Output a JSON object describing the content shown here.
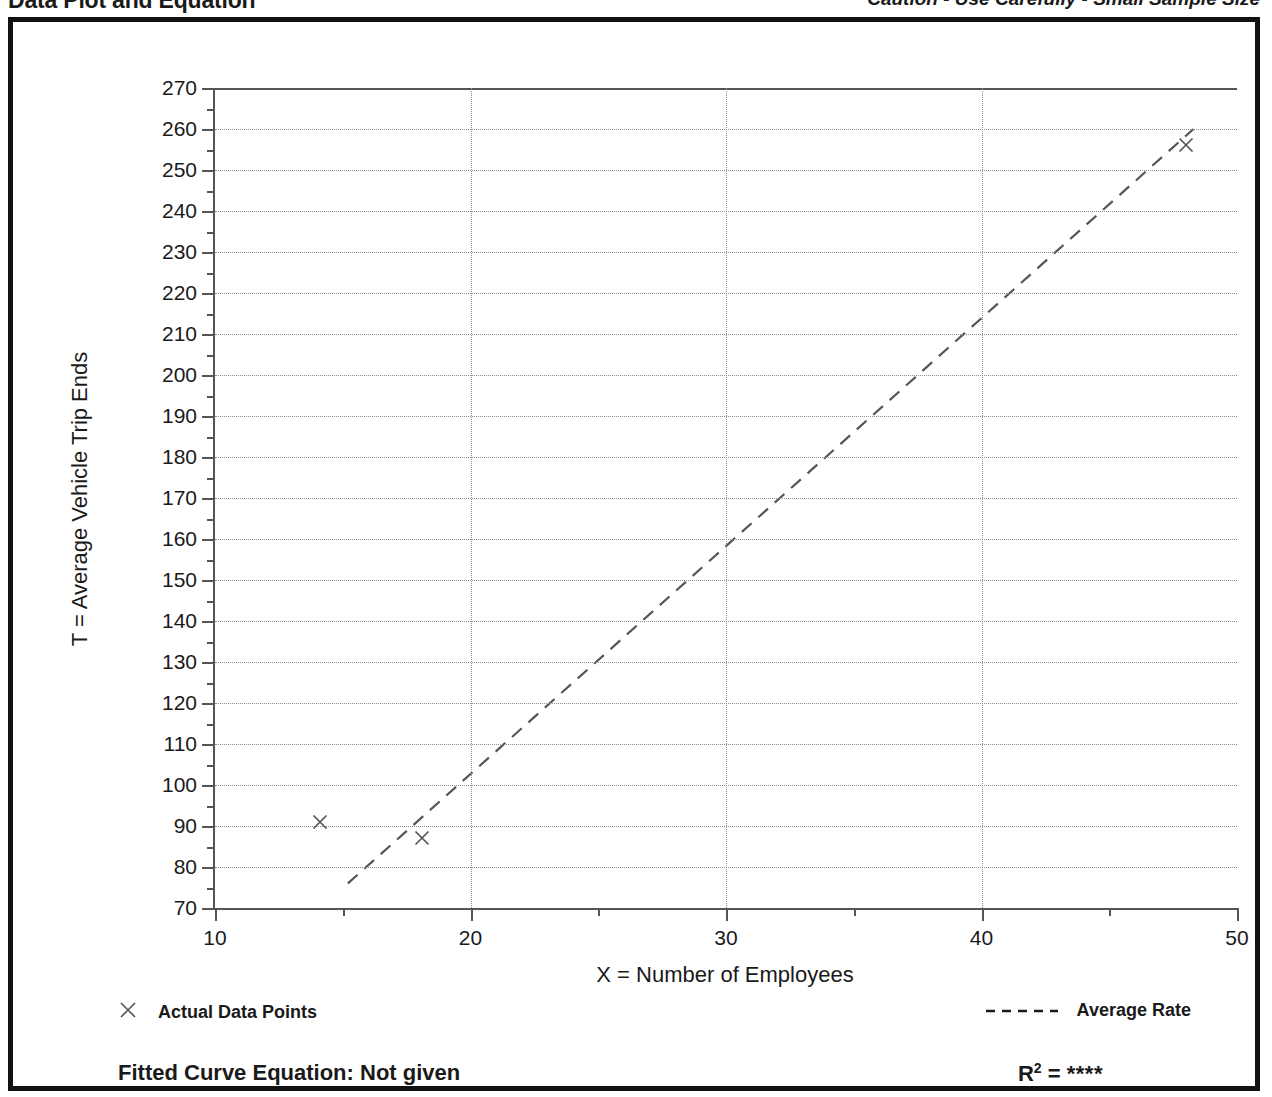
{
  "header": {
    "title": "Data Plot and Equation",
    "caution": "Caution - Use Carefully - Small Sample Size"
  },
  "legend": {
    "data_points_label": "Actual Data Points",
    "average_rate_label": "Average Rate",
    "data_points_marker": "x-marker-icon",
    "average_rate_marker": "dashed-line-icon"
  },
  "footer": {
    "equation_label": "Fitted Curve Equation:  Not given",
    "r2_prefix": "R",
    "r2_superscript": "2",
    "r2_equals": " = ",
    "r2_value": "****"
  },
  "colors": {
    "axis": "#555555",
    "grid": "#8d8d8d",
    "ink": "#1a1a1a",
    "frame": "#111111"
  },
  "chart_data": {
    "type": "scatter",
    "title": "Data Plot and Equation",
    "xlabel": "X = Number of Employees",
    "ylabel": "T = Average Vehicle Trip Ends",
    "xlim": [
      10,
      50
    ],
    "ylim": [
      70,
      270
    ],
    "xticks": [
      10,
      20,
      30,
      40,
      50
    ],
    "xtick_labels": [
      "10",
      "20",
      "30",
      "40",
      "50"
    ],
    "xminor_ticks": [
      15,
      25,
      35,
      45
    ],
    "yticks": [
      70,
      80,
      90,
      100,
      110,
      120,
      130,
      140,
      150,
      160,
      170,
      180,
      190,
      200,
      210,
      220,
      230,
      240,
      250,
      260,
      270
    ],
    "ytick_labels": [
      "70",
      "80",
      "90",
      "100",
      "110",
      "120",
      "130",
      "140",
      "150",
      "160",
      "170",
      "180",
      "190",
      "200",
      "210",
      "220",
      "230",
      "240",
      "250",
      "260",
      "270"
    ],
    "yminor_ticks": [
      75,
      85,
      95,
      105,
      115,
      125,
      135,
      145,
      155,
      165,
      175,
      185,
      195,
      205,
      215,
      225,
      235,
      245,
      255,
      265
    ],
    "grid": true,
    "legend_position": "below-plot",
    "series": [
      {
        "name": "Actual Data Points",
        "type": "scatter",
        "marker": "x",
        "points": [
          {
            "x": 14.1,
            "y": 91
          },
          {
            "x": 18.1,
            "y": 87
          },
          {
            "x": 48.0,
            "y": 256
          }
        ]
      },
      {
        "name": "Average Rate",
        "type": "line",
        "style": "dashed",
        "points": [
          {
            "x": 15.2,
            "y": 76
          },
          {
            "x": 48.3,
            "y": 260
          }
        ]
      }
    ]
  }
}
